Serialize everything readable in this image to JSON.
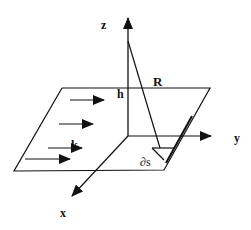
{
  "diagram": {
    "title": "",
    "type": "3D coordinate diagram of a flat plane with incident flow",
    "colors": {
      "stroke": "#111111",
      "background": "#ffffff"
    },
    "labels": {
      "z_axis": "z",
      "y_axis": "y",
      "x_axis": "x",
      "height": "h",
      "distance": "R",
      "wave_vector": "k",
      "surface_element": "∂s"
    },
    "axes": [
      {
        "name": "z",
        "direction": "up"
      },
      {
        "name": "y",
        "direction": "right"
      },
      {
        "name": "x",
        "direction": "down-left"
      }
    ],
    "flow_arrows_count": 4,
    "elements": [
      "parallelogram plane",
      "vertical z-axis with arrowhead",
      "slanted line R from z-axis point at height h to surface element",
      "small triangular surface element ∂s",
      "four parallel arrows indicating direction k"
    ]
  }
}
